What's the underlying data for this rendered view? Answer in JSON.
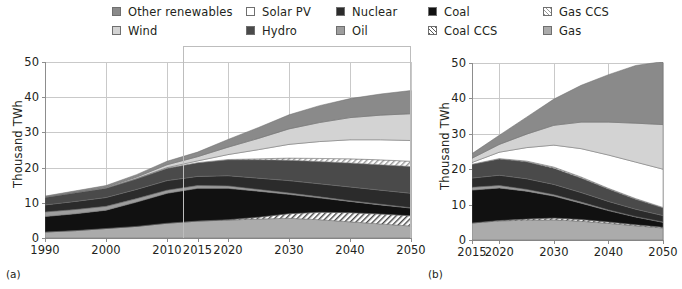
{
  "legend": {
    "columns": [
      {
        "x": 112,
        "items": [
          {
            "key": "other_renewables",
            "label": "Other renewables",
            "swatch": "f-other",
            "color": "#8a8a8a"
          },
          {
            "key": "wind",
            "label": "Wind",
            "swatch": "f-wind",
            "color": "#d3d3d3"
          }
        ]
      },
      {
        "x": 246,
        "items": [
          {
            "key": "solar_pv",
            "label": "Solar PV",
            "swatch": "f-solar",
            "color": "#ffffff"
          },
          {
            "key": "hydro",
            "label": "Hydro",
            "swatch": "f-hydro",
            "color": "#4a4a4a"
          }
        ]
      },
      {
        "x": 336,
        "items": [
          {
            "key": "nuclear",
            "label": "Nuclear",
            "swatch": "f-nuclear",
            "color": "#2b2b2b"
          },
          {
            "key": "oil",
            "label": "Oil",
            "swatch": "f-oil",
            "color": "#9d9d9d"
          }
        ]
      },
      {
        "x": 428,
        "items": [
          {
            "key": "coal",
            "label": "Coal",
            "swatch": "f-coal",
            "color": "#111111"
          },
          {
            "key": "coal_ccs",
            "label": "Coal CCS",
            "swatch": "f-coalccs",
            "color": "#ffffff"
          }
        ]
      },
      {
        "x": 543,
        "items": [
          {
            "key": "gas_ccs",
            "label": "Gas CCS",
            "swatch": "f-gasccs",
            "color": "#ffffff"
          },
          {
            "key": "gas",
            "label": "Gas",
            "swatch": "f-gas",
            "color": "#ababab"
          }
        ]
      }
    ]
  },
  "panels": [
    {
      "tag": "(a)",
      "tag_x": 6,
      "tag_y": 268,
      "ylabel": "Thousand TWh",
      "plot": {
        "x": 45,
        "y": 62,
        "w": 366,
        "h": 176
      },
      "highlight": {
        "x": 183,
        "y": 46,
        "w": 228,
        "h": 192
      }
    },
    {
      "tag": "(b)",
      "tag_x": 428,
      "tag_y": 268,
      "ylabel": "Thousand TWh",
      "plot": {
        "x": 472,
        "y": 63,
        "w": 191,
        "h": 177
      },
      "highlight": null
    }
  ],
  "chart_data": [
    {
      "id": "panel-a",
      "type": "area",
      "stacked": true,
      "title": "",
      "subtitle": "(a)",
      "xlabel": "",
      "ylabel": "Thousand TWh",
      "xlim": [
        1990,
        2050
      ],
      "ylim": [
        0,
        50
      ],
      "xticks": [
        1990,
        2000,
        2010,
        2015,
        2020,
        2030,
        2040,
        2050
      ],
      "yticks": [
        0,
        10,
        20,
        30,
        40,
        50
      ],
      "grid": true,
      "legend_position": "top",
      "annotation": "Highlight box from 2015 to 2050 marking the projection period",
      "x": [
        1990,
        1995,
        2000,
        2005,
        2010,
        2015,
        2020,
        2025,
        2030,
        2035,
        2040,
        2045,
        2050
      ],
      "series": [
        {
          "name": "Gas",
          "color": "#ababab",
          "values": [
            1.7,
            2.1,
            2.7,
            3.3,
            4.2,
            4.8,
            5.1,
            5.4,
            5.6,
            5.2,
            4.6,
            4.0,
            3.4
          ]
        },
        {
          "name": "Coal CCS",
          "color": "#ffffff",
          "hatch": "diagonal",
          "values": [
            0,
            0,
            0,
            0,
            0,
            0,
            0.1,
            0.5,
            1.3,
            2.1,
            2.6,
            2.8,
            2.9
          ]
        },
        {
          "name": "Coal",
          "color": "#111111",
          "values": [
            4.4,
            4.8,
            5.2,
            6.9,
            8.5,
            9.3,
            8.9,
            7.4,
            5.5,
            4.1,
            3.2,
            2.6,
            2.2
          ]
        },
        {
          "name": "Oil",
          "color": "#9d9d9d",
          "values": [
            1.3,
            1.2,
            1.1,
            1.0,
            0.9,
            0.8,
            0.7,
            0.5,
            0.4,
            0.3,
            0.2,
            0.2,
            0.1
          ]
        },
        {
          "name": "Nuclear",
          "color": "#2b2b2b",
          "values": [
            2.0,
            2.3,
            2.5,
            2.6,
            2.7,
            2.6,
            2.9,
            3.2,
            3.5,
            3.7,
            3.9,
            4.0,
            4.1
          ]
        },
        {
          "name": "Hydro",
          "color": "#4a4a4a",
          "values": [
            2.2,
            2.5,
            2.7,
            3.0,
            3.5,
            3.9,
            4.5,
            5.2,
            5.8,
            6.3,
            6.8,
            7.2,
            7.6
          ]
        },
        {
          "name": "Gas CCS",
          "color": "#ffffff",
          "hatch": "diagonal-light",
          "values": [
            0,
            0,
            0,
            0,
            0,
            0,
            0.1,
            0.3,
            0.6,
            0.9,
            1.2,
            1.4,
            1.5
          ]
        },
        {
          "name": "Solar PV",
          "color": "#ffffff",
          "values": [
            0,
            0,
            0,
            0.1,
            0.2,
            0.5,
            1.4,
            2.6,
            3.9,
            4.8,
            5.4,
            5.7,
            5.9
          ]
        },
        {
          "name": "Wind",
          "color": "#d3d3d3",
          "values": [
            0,
            0.1,
            0.2,
            0.4,
            0.8,
            1.2,
            2.1,
            3.2,
            4.4,
            5.4,
            6.3,
            7.0,
            7.6
          ]
        },
        {
          "name": "Other renewables",
          "color": "#8a8a8a",
          "values": [
            0.3,
            0.4,
            0.5,
            0.7,
            1.0,
            1.3,
            2.2,
            3.1,
            4.0,
            4.8,
            5.4,
            6.0,
            6.6
          ]
        }
      ],
      "totals": [
        11.9,
        13.4,
        14.9,
        18.0,
        21.8,
        24.4,
        28.0,
        31.4,
        35.0,
        37.6,
        39.6,
        40.9,
        41.9
      ]
    },
    {
      "id": "panel-b",
      "type": "area",
      "stacked": true,
      "title": "",
      "subtitle": "(b)",
      "xlabel": "",
      "ylabel": "Thousand TWh",
      "xlim": [
        2015,
        2050
      ],
      "ylim": [
        0,
        50
      ],
      "xticks": [
        2015,
        2020,
        2030,
        2040,
        2050
      ],
      "yticks": [
        0,
        10,
        20,
        30,
        40,
        50
      ],
      "grid": true,
      "legend_position": "top",
      "x": [
        2015,
        2020,
        2025,
        2030,
        2035,
        2040,
        2045,
        2050
      ],
      "series": [
        {
          "name": "Gas",
          "color": "#ababab",
          "values": [
            4.8,
            5.4,
            5.6,
            5.7,
            5.3,
            4.7,
            4.0,
            3.4
          ]
        },
        {
          "name": "Coal CCS",
          "color": "#ffffff",
          "hatch": "diagonal",
          "values": [
            0,
            0.1,
            0.3,
            0.5,
            0.5,
            0.4,
            0.3,
            0.2
          ]
        },
        {
          "name": "Coal",
          "color": "#111111",
          "values": [
            9.3,
            9.2,
            7.9,
            6.2,
            4.6,
            3.2,
            2.2,
            1.4
          ]
        },
        {
          "name": "Oil",
          "color": "#9d9d9d",
          "values": [
            0.8,
            0.7,
            0.5,
            0.4,
            0.3,
            0.2,
            0.1,
            0.1
          ]
        },
        {
          "name": "Nuclear",
          "color": "#2b2b2b",
          "values": [
            2.6,
            2.9,
            3.0,
            2.9,
            2.7,
            2.4,
            2.1,
            1.8
          ]
        },
        {
          "name": "Hydro",
          "color": "#4a4a4a",
          "values": [
            3.9,
            4.6,
            4.8,
            4.6,
            4.1,
            3.5,
            2.8,
            2.2
          ]
        },
        {
          "name": "Gas CCS",
          "color": "#ffffff",
          "hatch": "diagonal-light",
          "values": [
            0,
            0.1,
            0.2,
            0.3,
            0.3,
            0.2,
            0.2,
            0.1
          ]
        },
        {
          "name": "Solar PV",
          "color": "#ffffff",
          "values": [
            0.5,
            1.8,
            3.8,
            6.2,
            8.0,
            9.4,
            10.3,
            10.8
          ]
        },
        {
          "name": "Wind",
          "color": "#d3d3d3",
          "values": [
            1.2,
            2.2,
            3.8,
            5.6,
            7.5,
            9.3,
            11.0,
            12.6
          ]
        },
        {
          "name": "Other renewables",
          "color": "#8a8a8a",
          "values": [
            1.3,
            2.6,
            4.8,
            7.4,
            10.4,
            13.4,
            16.3,
            17.8
          ]
        }
      ],
      "totals": [
        24.4,
        29.6,
        34.7,
        39.8,
        43.7,
        46.7,
        49.3,
        50.4
      ]
    }
  ]
}
